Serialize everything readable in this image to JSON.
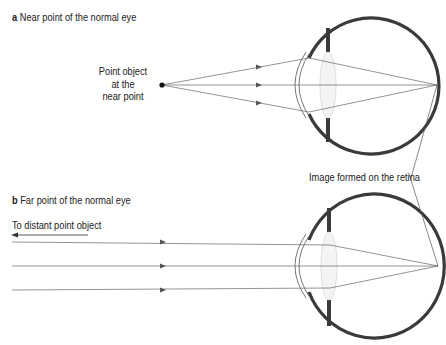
{
  "panel_a": {
    "letter": "a",
    "title": "Near point of the normal eye",
    "object_label_line1": "Point object",
    "object_label_line2": "at the",
    "object_label_line3": "near point"
  },
  "panel_b": {
    "letter": "b",
    "title": "Far point of the normal eye",
    "object_label": "To distant point object"
  },
  "shared": {
    "retina_label": "Image formed on the retina"
  },
  "colors": {
    "eye_wall": "#3a3a3a",
    "ray": "#666666",
    "text": "#222222"
  }
}
